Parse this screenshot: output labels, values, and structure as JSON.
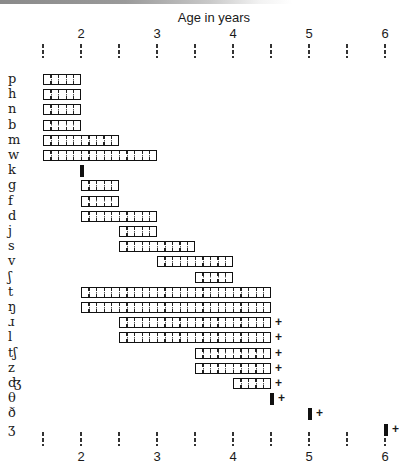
{
  "chart_data": {
    "type": "bar",
    "subtype": "horizontal-range (Gantt-style)",
    "title": "Age in years",
    "xlabel": "Age in years",
    "ylabel": "",
    "xlim": [
      1.5,
      6
    ],
    "x_ticks": [
      1.5,
      2,
      2.5,
      3,
      3.5,
      4,
      4.5,
      5,
      5.5,
      6
    ],
    "x_tick_labels": [
      "",
      "2",
      "",
      "3",
      "",
      "4",
      "",
      "5",
      "",
      "6"
    ],
    "axis_positions": [
      "top",
      "bottom"
    ],
    "grid": false,
    "legend": null,
    "annotations": "'+' after a bar indicates acquisition continues beyond that age; solid black marker indicates a single point",
    "categories": [
      "p",
      "h",
      "n",
      "b",
      "m",
      "w",
      "k",
      "g",
      "f",
      "d",
      "j",
      "s",
      "v",
      "ʃ",
      "t",
      "ŋ",
      "ɹ",
      "l",
      "tʃ",
      "z",
      "ʤ",
      "θ",
      "ð",
      "ʒ"
    ],
    "series": [
      {
        "label": "p",
        "start": 1.5,
        "end": 2,
        "kind": "range",
        "plus": false
      },
      {
        "label": "h",
        "start": 1.5,
        "end": 2,
        "kind": "range",
        "plus": false
      },
      {
        "label": "n",
        "start": 1.5,
        "end": 2,
        "kind": "range",
        "plus": false
      },
      {
        "label": "b",
        "start": 1.5,
        "end": 2,
        "kind": "range",
        "plus": false
      },
      {
        "label": "m",
        "start": 1.5,
        "end": 2.5,
        "kind": "range",
        "plus": false
      },
      {
        "label": "w",
        "start": 1.5,
        "end": 3,
        "kind": "range",
        "plus": false
      },
      {
        "label": "k",
        "start": 2,
        "end": 2,
        "kind": "point",
        "plus": false
      },
      {
        "label": "g",
        "start": 2,
        "end": 2.5,
        "kind": "range",
        "plus": false
      },
      {
        "label": "f",
        "start": 2,
        "end": 2.5,
        "kind": "range",
        "plus": false
      },
      {
        "label": "d",
        "start": 2,
        "end": 3,
        "kind": "range",
        "plus": false
      },
      {
        "label": "j",
        "start": 2.5,
        "end": 3,
        "kind": "range",
        "plus": false
      },
      {
        "label": "s",
        "start": 2.5,
        "end": 3.5,
        "kind": "range",
        "plus": false
      },
      {
        "label": "v",
        "start": 3,
        "end": 4,
        "kind": "range",
        "plus": false
      },
      {
        "label": "ʃ",
        "start": 3.5,
        "end": 4,
        "kind": "range",
        "plus": false
      },
      {
        "label": "t",
        "start": 2,
        "end": 4.5,
        "kind": "range",
        "plus": false
      },
      {
        "label": "ŋ",
        "start": 2,
        "end": 4.5,
        "kind": "range",
        "plus": false
      },
      {
        "label": "ɹ",
        "start": 2.5,
        "end": 4.5,
        "kind": "range",
        "plus": true
      },
      {
        "label": "l",
        "start": 2.5,
        "end": 4.5,
        "kind": "range",
        "plus": true
      },
      {
        "label": "tʃ",
        "start": 3.5,
        "end": 4.5,
        "kind": "range",
        "plus": true
      },
      {
        "label": "z",
        "start": 3.5,
        "end": 4.5,
        "kind": "range",
        "plus": true
      },
      {
        "label": "ʤ",
        "start": 4,
        "end": 4.5,
        "kind": "range",
        "plus": true
      },
      {
        "label": "θ",
        "start": 4.5,
        "end": 4.5,
        "kind": "point",
        "plus": true
      },
      {
        "label": "ð",
        "start": 5,
        "end": 5,
        "kind": "point",
        "plus": true
      },
      {
        "label": "ʒ",
        "start": 6,
        "end": 6,
        "kind": "point",
        "plus": true
      }
    ]
  },
  "plus_symbol": "+",
  "colors": {
    "ink": "#111111",
    "background": "#ffffff"
  }
}
